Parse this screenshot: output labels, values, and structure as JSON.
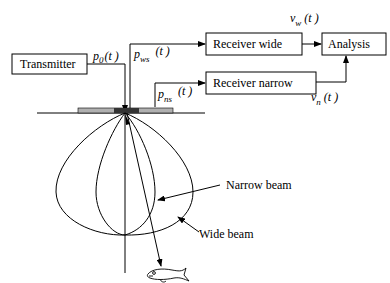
{
  "diagram": {
    "blocks": {
      "transmitter": "Transmitter",
      "receiver_wide": "Receiver wide",
      "receiver_narrow": "Receiver narrow",
      "analysis": "Analysis"
    },
    "signals": {
      "p0": {
        "base": "p",
        "sub": "0",
        "arg": "(t )"
      },
      "pws": {
        "base": "p",
        "sub": "ws",
        "arg": "(t )"
      },
      "pns": {
        "base": "p",
        "sub": "ns",
        "arg": "(t )"
      },
      "vw": {
        "base": "v",
        "sub": "w",
        "arg": "(t )"
      },
      "vn": {
        "base": "v",
        "sub": "n",
        "arg": "(t )"
      }
    },
    "annotations": {
      "narrow_beam": "Narrow beam",
      "wide_beam": "Wide beam"
    },
    "icons": [
      "transducer-icon",
      "fish-icon"
    ],
    "colors": {
      "line": "#000000",
      "transducer_outer": "#b0b0b0",
      "transducer_center": "#333333"
    }
  }
}
